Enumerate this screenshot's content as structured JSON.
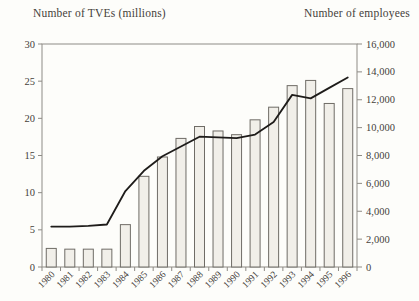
{
  "chart_data": {
    "type": "combo",
    "title": "",
    "categories": [
      "1980",
      "1981",
      "1982",
      "1983",
      "1984",
      "1985",
      "1986",
      "1987",
      "1988",
      "1989",
      "1990",
      "1991",
      "1992",
      "1993",
      "1994",
      "1995",
      "1996"
    ],
    "series": [
      {
        "name": "Number of TVEs (millions)",
        "type": "bar",
        "axis": "left",
        "values": [
          2.5,
          2.4,
          2.4,
          2.4,
          5.7,
          12.2,
          14.8,
          17.3,
          18.9,
          18.3,
          17.8,
          19.8,
          21.5,
          24.4,
          25.1,
          22.0,
          24.0
        ]
      },
      {
        "name": "Number of employees",
        "type": "line",
        "axis": "right",
        "values": [
          2900,
          2900,
          2950,
          3050,
          5450,
          6900,
          7950,
          8650,
          9350,
          9300,
          9250,
          9500,
          10400,
          12350,
          12100,
          12850,
          13600
        ]
      }
    ],
    "left_axis": {
      "label": "Number of TVEs (millions)",
      "ticks": [
        0,
        5,
        10,
        15,
        20,
        25,
        30
      ],
      "range": [
        0,
        30
      ]
    },
    "right_axis": {
      "label": "Number of employees",
      "ticks": [
        0,
        2000,
        4000,
        6000,
        8000,
        10000,
        12000,
        14000,
        16000
      ],
      "range": [
        0,
        16000
      ],
      "tick_format": "comma"
    },
    "x_axis": {
      "label_rotation_deg": -45
    },
    "grid": false,
    "legend": false
  },
  "colors": {
    "background": "#fdfdfa",
    "text": "#45413a",
    "frame": "#8e8b85",
    "bar_fill": "#f1efe9",
    "bar_stroke": "#6f6c66",
    "line": "#1e1c1a"
  }
}
